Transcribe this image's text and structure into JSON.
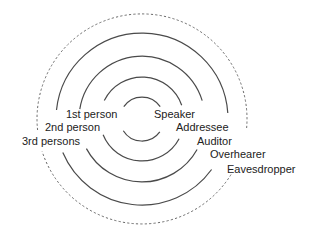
{
  "title": "",
  "center": {
    "x": 142,
    "y": 119
  },
  "labels": {
    "left": [
      {
        "text": "1st person",
        "x": 66,
        "y": 109
      },
      {
        "text": "2nd person",
        "x": 45,
        "y": 122
      },
      {
        "text": "3rd persons",
        "x": 22,
        "y": 136
      }
    ],
    "right": [
      {
        "text": "Speaker",
        "x": 154,
        "y": 109
      },
      {
        "text": "Addressee",
        "x": 176,
        "y": 122
      },
      {
        "text": "Auditor",
        "x": 197,
        "y": 136
      },
      {
        "text": "Overhearer",
        "x": 210,
        "y": 149
      },
      {
        "text": "Eavesdropper",
        "x": 227,
        "y": 164
      }
    ]
  },
  "rings": [
    {
      "name": "speaker-ring",
      "r": 22,
      "style": "solid",
      "upper_left": 214,
      "upper_right": -34,
      "lower_right": 36,
      "lower_left": 148
    },
    {
      "name": "addressee-ring",
      "r": 42,
      "style": "solid",
      "upper_left": 206,
      "upper_right": -19,
      "lower_right": 28,
      "lower_left": 158
    },
    {
      "name": "auditor-ring",
      "r": 63,
      "style": "solid",
      "upper_left": 189,
      "upper_right": -17,
      "lower_right": 29,
      "lower_left": 152
    },
    {
      "name": "overhearer-ring",
      "r": 86,
      "style": "solid",
      "upper_left": 186,
      "upper_right": -4,
      "lower_right": 36,
      "lower_left": 157
    },
    {
      "name": "eavesdropper-ring",
      "r": 105,
      "style": "dashed",
      "upper_left": 174,
      "upper_right": 5,
      "lower_right": 32,
      "lower_left": 162
    }
  ],
  "colors": {
    "line": "#4a4a4a",
    "dashed": "#6a6a6a",
    "text": "#222222",
    "background": "#ffffff"
  }
}
